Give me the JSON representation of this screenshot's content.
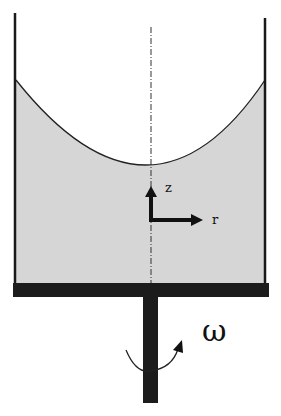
{
  "figure": {
    "colors": {
      "background": "#ffffff",
      "liquid": "#d6d6d6",
      "walls": "#1a1a1a",
      "base": "#1c1c1c"
    },
    "labels": {
      "z_axis": "z",
      "r_axis": "r",
      "omega": "ω"
    },
    "icons": {
      "rotation": "curved-arrow-icon",
      "axes": "coordinate-axes-icon"
    }
  }
}
